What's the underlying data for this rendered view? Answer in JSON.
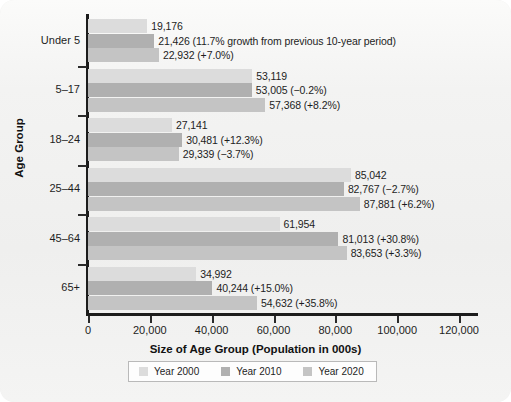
{
  "chart_data": {
    "type": "bar",
    "orientation": "horizontal",
    "title": "",
    "xlabel": "Size of Age Group (Population in 000s)",
    "ylabel": "Age Group",
    "xlim": [
      0,
      120000
    ],
    "xticks": [
      "0",
      "20,000",
      "40,000",
      "60,000",
      "80,000",
      "100,000",
      "120,000"
    ],
    "xtick_values": [
      0,
      20000,
      40000,
      60000,
      80000,
      100000,
      120000
    ],
    "grid": false,
    "legend_position": "bottom",
    "categories": [
      "Under 5",
      "5–17",
      "18–24",
      "25–44",
      "45–64",
      "65+"
    ],
    "series": [
      {
        "name": "Year 2000",
        "color": "#dcdcdc",
        "values": [
          19176,
          53119,
          27141,
          85042,
          61954,
          34992
        ],
        "labels": [
          "19,176",
          "53,119",
          "27,141",
          "85,042",
          "61,954",
          "34,992"
        ]
      },
      {
        "name": "Year 2010",
        "color": "#b0b0b0",
        "values": [
          21426,
          53005,
          30481,
          82767,
          81013,
          40244
        ],
        "labels": [
          "21,426 (11.7% growth from previous 10-year period)",
          "53,005 (−0.2%)",
          "30,481 (+12.3%)",
          "82,767 (−2.7%)",
          "81,013 (+30.8%)",
          "40,244 (+15.0%)"
        ]
      },
      {
        "name": "Year 2020",
        "color": "#c4c4c4",
        "values": [
          22932,
          57368,
          29339,
          87881,
          83653,
          54632
        ],
        "labels": [
          "22,932 (+7.0%)",
          "57,368 (+8.2%)",
          "29,339 (−3.7%)",
          "87,881 (+6.2%)",
          "83,653 (+3.3%)",
          "54,632 (+35.8%)"
        ]
      }
    ]
  },
  "legend": {
    "items": [
      {
        "label": "Year 2000",
        "color": "#dcdcdc"
      },
      {
        "label": "Year 2010",
        "color": "#b0b0b0"
      },
      {
        "label": "Year 2020",
        "color": "#c4c4c4"
      }
    ]
  },
  "axis": {
    "x_title": "Size of Age Group (Population in 000s)",
    "y_title": "Age Group"
  }
}
